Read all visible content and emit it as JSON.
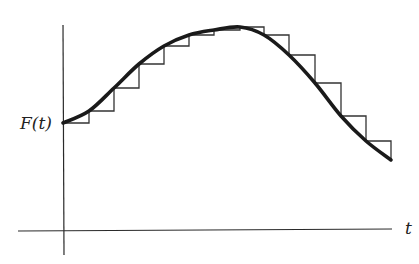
{
  "diagram": {
    "y_label": "F(t)",
    "x_label": "t",
    "colors": {
      "curve": "#1a1a1a",
      "steps": "#333333",
      "axes": "#2a2a2a",
      "background": "#ffffff"
    }
  },
  "chart_data": {
    "type": "line",
    "title": "",
    "xlabel": "t",
    "ylabel": "F(t)",
    "series": [
      {
        "name": "F(t) curve",
        "x": [
          63,
          89,
          114,
          139,
          164,
          189,
          214,
          240,
          264,
          289,
          315,
          341,
          366,
          391
        ],
        "y": [
          123,
          111,
          88,
          64,
          46,
          35,
          30,
          27,
          35,
          55,
          83,
          116,
          141,
          160
        ]
      },
      {
        "name": "step approximation",
        "x": [
          63,
          89,
          114,
          139,
          164,
          189,
          214,
          240,
          264,
          289,
          315,
          341,
          366,
          391
        ],
        "y": [
          123,
          111,
          88,
          64,
          46,
          35,
          30,
          27,
          35,
          55,
          83,
          116,
          141,
          160
        ]
      }
    ],
    "axes": {
      "origin_x": 63,
      "baseline_y": 230
    }
  }
}
